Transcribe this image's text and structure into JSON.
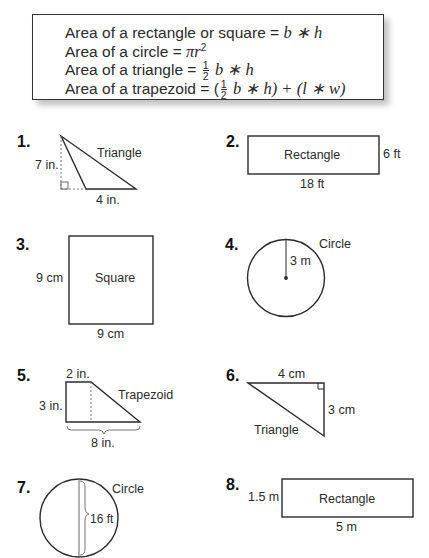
{
  "formulas": {
    "rectangle": {
      "text": "Area of a rectangle or square",
      "expr": "b ∗ h"
    },
    "circle": {
      "text": "Area of a circle",
      "expr": "πr",
      "sup": "2"
    },
    "triangle": {
      "text": "Area of a triangle",
      "frac_num": "1",
      "frac_den": "2",
      "expr": "b ∗ h"
    },
    "trapezoid": {
      "text": "Area of a trapezoid",
      "open": "(",
      "frac_num": "1",
      "frac_den": "2",
      "expr1": "b ∗ h) + (",
      "expr2": "l ∗ w)"
    }
  },
  "equals": "=",
  "problems": [
    {
      "number": "1.",
      "shape": "Triangle",
      "height": "7 in.",
      "base": "4 in."
    },
    {
      "number": "2.",
      "shape": "Rectangle",
      "height": "6 ft",
      "base": "18 ft"
    },
    {
      "number": "3.",
      "shape": "Square",
      "height": "9 cm",
      "base": "9 cm"
    },
    {
      "number": "4.",
      "shape": "Circle",
      "radius": "3 m"
    },
    {
      "number": "5.",
      "shape": "Trapezoid",
      "top": "2 in.",
      "height": "3 in.",
      "base": "8 in."
    },
    {
      "number": "6.",
      "shape": "Triangle",
      "base": "4 cm",
      "height": "3 cm"
    },
    {
      "number": "7.",
      "shape": "Circle",
      "diameter": "16 ft"
    },
    {
      "number": "8.",
      "shape": "Rectangle",
      "height": "1.5 m",
      "base": "5 m"
    }
  ]
}
